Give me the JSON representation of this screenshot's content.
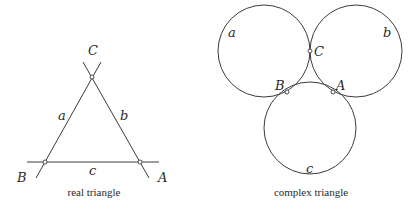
{
  "real_triangle": {
    "caption": "real triangle",
    "vertices": {
      "A": "A",
      "B": "B",
      "C": "C"
    },
    "sides": {
      "a": "a",
      "b": "b",
      "c": "c"
    }
  },
  "complex_triangle": {
    "caption": "complex triangle",
    "vertices": {
      "A": "A",
      "B": "B",
      "C": "C"
    },
    "circles": {
      "a": "a",
      "b": "b",
      "c": "c"
    }
  },
  "colors": {
    "stroke": "#3a3a3a",
    "text": "#2a2a2a",
    "background": "#ffffff"
  }
}
